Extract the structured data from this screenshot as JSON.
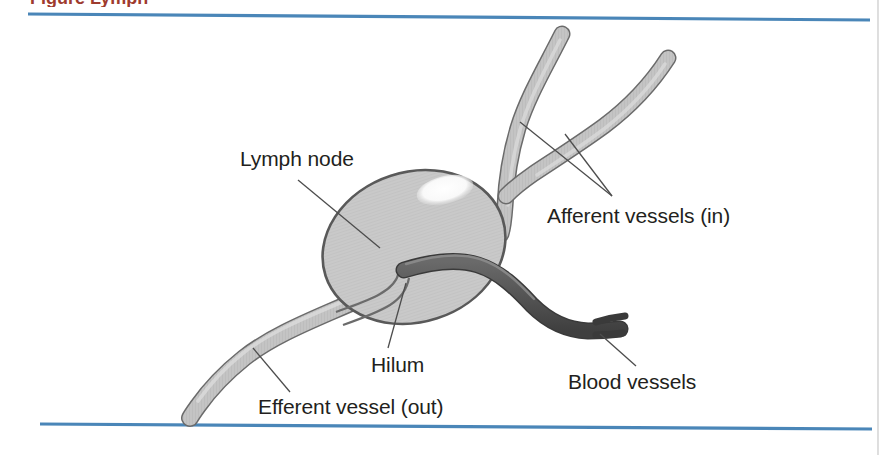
{
  "figure": {
    "title_fragment": "Figure  Lymph",
    "title_note": "caption cropped at top edge of scan",
    "labels": [
      {
        "id": "lymph-node",
        "text": "Lymph node",
        "x": 240,
        "y": 166
      },
      {
        "id": "afferent",
        "text": "Afferent vessels (in)",
        "x": 547,
        "y": 223
      },
      {
        "id": "hilum",
        "text": "Hilum",
        "x": 371,
        "y": 372
      },
      {
        "id": "blood-vessels",
        "text": "Blood vessels",
        "x": 568,
        "y": 389
      },
      {
        "id": "efferent",
        "text": "Efferent vessel (out)",
        "x": 258,
        "y": 414
      }
    ],
    "colors": {
      "rule_blue": "#4a86b8",
      "node_fill": "#c9c9c9",
      "node_stroke": "#595959",
      "node_highlight": "#fdfdfd",
      "lymph_vessel_fill": "#c3c3c3",
      "lymph_vessel_stroke": "#6b6b6b",
      "blood_vessel_fill": "#585858",
      "blood_vessel_stroke": "#3a3a3a",
      "label_text": "#231f20",
      "leader_line": "#4d4d4d",
      "caption_red": "#9e3b2e"
    },
    "rules": {
      "top": {
        "x1": 28,
        "y1": 14,
        "x2": 870,
        "y2": 20
      },
      "bottom": {
        "x1": 40,
        "y1": 424,
        "x2": 872,
        "y2": 429
      }
    },
    "parts": [
      {
        "id": "lymph-node-body",
        "kind": "ellipse",
        "description": "tilted gray oval node"
      },
      {
        "id": "node-highlight",
        "kind": "ellipse",
        "description": "white specular highlight"
      },
      {
        "id": "afferent-vessel-1",
        "kind": "tube",
        "description": "upper-left afferent lymph vessel"
      },
      {
        "id": "afferent-vessel-2",
        "kind": "tube",
        "description": "right afferent lymph vessel"
      },
      {
        "id": "efferent-vessel",
        "kind": "tube",
        "description": "efferent lymph vessel exiting hilum to lower left"
      },
      {
        "id": "blood-vessel",
        "kind": "tube",
        "description": "dark blood vessel from hilum to lower right"
      },
      {
        "id": "hilum-notch",
        "kind": "contour",
        "description": "indentation of node where vessels enter"
      }
    ]
  }
}
